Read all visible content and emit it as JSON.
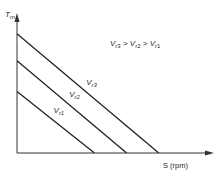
{
  "chart_data": {
    "type": "line",
    "title": "",
    "xlabel": "S (rpm)",
    "ylabel": "T_m",
    "annotation": {
      "text_parts": [
        "V",
        "r3",
        " > ",
        "V",
        "r2",
        " > ",
        "V",
        "r1"
      ]
    },
    "xlim": [
      0,
      1
    ],
    "ylim": [
      0,
      1
    ],
    "series": [
      {
        "name": "Vr1",
        "label_main": "V",
        "label_sub": "r1",
        "x": [
          0,
          0.41
        ],
        "y": [
          0.5,
          0
        ]
      },
      {
        "name": "Vr2",
        "label_main": "V",
        "label_sub": "r2",
        "x": [
          0,
          0.58
        ],
        "y": [
          0.75,
          0
        ]
      },
      {
        "name": "Vr3",
        "label_main": "V",
        "label_sub": "r3",
        "x": [
          0,
          0.75
        ],
        "y": [
          0.97,
          0
        ]
      }
    ],
    "grid": false,
    "line_color": "#222222"
  }
}
